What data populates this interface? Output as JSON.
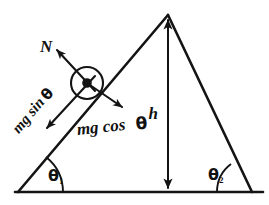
{
  "figure": {
    "background_color": "#ffffff",
    "ink_color": "#141414"
  },
  "labels": {
    "normal_force": "N",
    "mg_sin_theta": "mg sin θ",
    "mg_sin_theta_parts": {
      "roman": "mg sin",
      "greek": "θ"
    },
    "mg_cos_theta": "mg cos θ",
    "mg_cos_theta_parts": {
      "roman": "mg cos",
      "greek": "θ"
    },
    "height": "h",
    "angle_left": "θ",
    "angle_left_subscript": "1",
    "angle_right": "θ",
    "angle_right_subscript": "2"
  },
  "geometry": {
    "apex": {
      "x": 168,
      "y": 15
    },
    "left_vertex": {
      "x": 18,
      "y": 192
    },
    "right_vertex": {
      "x": 252,
      "y": 192
    },
    "base_line": {
      "x1": 15,
      "y1": 192,
      "x2": 263,
      "y2": 192
    },
    "block": {
      "cx": 87,
      "cy": 83,
      "r": 16,
      "dot_r": 4.6
    },
    "height_arrow": {
      "x": 168,
      "y_top": 17,
      "y_bottom": 191
    }
  },
  "vectors": [
    {
      "name": "normal-force",
      "label": "N",
      "from": {
        "x": 87,
        "y": 83
      },
      "to": {
        "x": 56,
        "y": 49
      },
      "direction": "up-left, perpendicular to incline"
    },
    {
      "name": "mg-sin-theta",
      "label": "mg sin θ",
      "from": {
        "x": 87,
        "y": 83
      },
      "to": {
        "x": 46,
        "y": 129
      },
      "direction": "down-left, along incline surface"
    },
    {
      "name": "mg-cos-theta",
      "label": "mg cos θ",
      "from": {
        "x": 87,
        "y": 83
      },
      "to": {
        "x": 123,
        "y": 108
      },
      "direction": "down-right, perpendicular into incline"
    }
  ],
  "annotations": {
    "height_measure": "h",
    "height_arrow_style": "double-headed vertical arrow"
  }
}
